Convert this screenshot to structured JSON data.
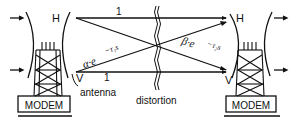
{
  "diagram": {
    "left_station": {
      "modem_label": "MODEM",
      "polarization_h": "H",
      "polarization_v": "V",
      "antenna_label": "antenna"
    },
    "right_station": {
      "modem_label": "MODEM",
      "polarization_h": "H",
      "polarization_v": "V"
    },
    "paths": {
      "direct_top_gain": "1",
      "direct_bottom_gain": "1",
      "cross_alpha": "α·e",
      "cross_alpha_exp": "−τ₁s",
      "cross_beta": "β·e",
      "cross_beta_exp": "−τ₂s"
    },
    "channel_label": "distortion"
  }
}
